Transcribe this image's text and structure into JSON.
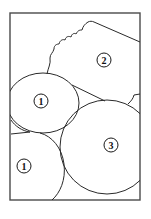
{
  "diagram": {
    "type": "region-partition",
    "frame": {
      "x": 10,
      "y": 13,
      "width": 130,
      "height": 187
    },
    "regions": [
      {
        "id": "region-2",
        "label": "2",
        "label_pos": [
          104,
          60
        ]
      },
      {
        "id": "region-1-upper",
        "label": "1",
        "label_pos": [
          41,
          101
        ]
      },
      {
        "id": "region-3",
        "label": "3",
        "label_pos": [
          111,
          145
        ]
      },
      {
        "id": "region-1-lower",
        "label": "1",
        "label_pos": [
          24,
          166
        ]
      }
    ],
    "colors": {
      "line": "#2a2a2a",
      "frame": "#4a4a4a",
      "background": "#ffffff"
    }
  }
}
